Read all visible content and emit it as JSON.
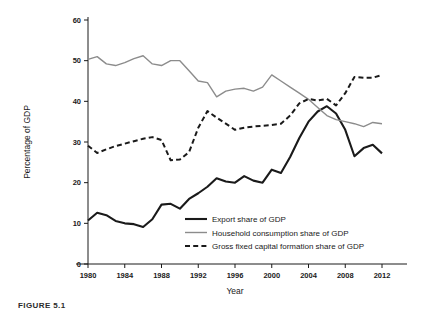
{
  "figure": {
    "caption": "FIGURE 5.1",
    "xlabel": "Year",
    "ylabel": "Percentage of GDP"
  },
  "axes": {
    "y_ticks": [
      "0",
      "10",
      "20",
      "30",
      "40",
      "50",
      "60"
    ],
    "x_ticks": [
      "1980",
      "1984",
      "1988",
      "1992",
      "1996",
      "2000",
      "2004",
      "2008",
      "2012"
    ]
  },
  "legend": {
    "items": [
      {
        "label": "Export share of GDP",
        "style": "solid-black",
        "color": "#1a1a1a"
      },
      {
        "label": "Household consumption share of GDP",
        "style": "solid-gray",
        "color": "#8c8c8c"
      },
      {
        "label": "Gross fixed capital formation share of GDP",
        "style": "dashed-black",
        "color": "#1a1a1a"
      }
    ]
  },
  "chart_data": {
    "type": "line",
    "title": "",
    "xlabel": "Year",
    "ylabel": "Percentage of GDP",
    "xlim": [
      1980,
      2012
    ],
    "ylim": [
      0,
      60
    ],
    "grid": false,
    "legend_position": "inside-bottom-center",
    "x": [
      1980,
      1981,
      1982,
      1983,
      1984,
      1985,
      1986,
      1987,
      1988,
      1989,
      1990,
      1991,
      1992,
      1993,
      1994,
      1995,
      1996,
      1997,
      1998,
      1999,
      2000,
      2001,
      2002,
      2003,
      2004,
      2005,
      2006,
      2007,
      2008,
      2009,
      2010,
      2011,
      2012
    ],
    "series": [
      {
        "name": "Export share of GDP",
        "color": "#1a1a1a",
        "style": "solid",
        "width": 2.1,
        "values": [
          10.7,
          12.6,
          12.0,
          10.6,
          10.0,
          9.8,
          9.1,
          11.0,
          14.6,
          14.8,
          13.6,
          16.0,
          17.4,
          19.0,
          21.1,
          20.3,
          20.0,
          21.6,
          20.5,
          20.0,
          23.2,
          22.4,
          26.3,
          31.0,
          35.0,
          37.5,
          38.8,
          37.0,
          33.0,
          26.5,
          28.5,
          29.3,
          27.2
        ]
      },
      {
        "name": "Household consumption share of GDP",
        "color": "#8c8c8c",
        "style": "solid",
        "width": 1.4,
        "values": [
          50.3,
          51.0,
          49.2,
          48.8,
          49.5,
          50.5,
          51.2,
          49.2,
          48.8,
          50.0,
          50.0,
          47.5,
          45.0,
          44.6,
          41.1,
          42.5,
          43.0,
          43.2,
          42.5,
          43.5,
          46.5,
          45.0,
          43.5,
          42.0,
          40.5,
          38.5,
          36.5,
          35.5,
          35.0,
          34.5,
          33.8,
          34.8,
          34.5
        ]
      },
      {
        "name": "Gross fixed capital formation share of GDP",
        "color": "#1a1a1a",
        "style": "dashed",
        "width": 2.0,
        "values": [
          29.1,
          27.3,
          28.2,
          29.0,
          29.6,
          30.2,
          30.8,
          31.2,
          30.5,
          25.5,
          25.7,
          27.5,
          33.5,
          37.6,
          36.0,
          34.5,
          33.0,
          33.5,
          33.8,
          34.0,
          34.2,
          34.5,
          36.5,
          39.5,
          40.6,
          40.2,
          40.6,
          39.0,
          42.0,
          46.0,
          45.8,
          45.8,
          46.5
        ]
      }
    ]
  }
}
